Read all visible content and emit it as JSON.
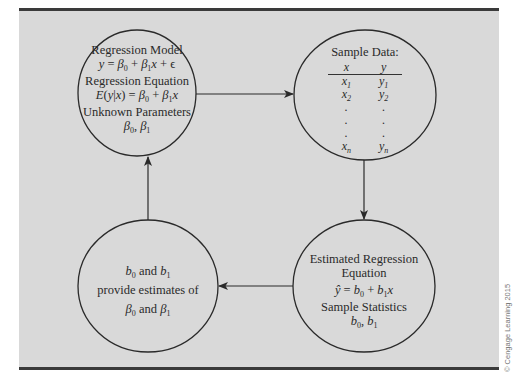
{
  "figure": {
    "type": "regression-process-flow",
    "colors": {
      "panel_background": "#d9d9d9",
      "rule_color": "#3a3a3a",
      "stroke": "#2a2a2a",
      "text": "#2a2a2a"
    },
    "copyright": "© Cengage Learning 2015"
  },
  "nodes": {
    "regression_model": {
      "title": "Regression Model",
      "model_equation": "y = β₀ + β₁x + ϵ",
      "eq_title": "Regression Equation",
      "regression_equation": "E(y|x) = β₀ + β₁x",
      "params_title": "Unknown Parameters",
      "params": "β₀, β₁"
    },
    "sample_data": {
      "title": "Sample Data:",
      "columns": [
        "x",
        "y"
      ],
      "rows": [
        [
          "x1",
          "y1"
        ],
        [
          "x2",
          "y2"
        ],
        [
          ".",
          "."
        ],
        [
          ".",
          "."
        ],
        [
          ".",
          "."
        ],
        [
          "xn",
          "yn"
        ]
      ]
    },
    "estimated_equation": {
      "title_line1": "Estimated Regression",
      "title_line2": "Equation",
      "equation": "ŷ = b₀ + b₁x",
      "stats_title": "Sample Statistics",
      "stats": "b₀, b₁"
    },
    "estimates": {
      "line1": "b₀ and b₁",
      "line2": "provide estimates of",
      "line3": "β₀ and β₁"
    }
  },
  "edges": [
    {
      "from": "regression_model",
      "to": "sample_data",
      "direction": "right"
    },
    {
      "from": "sample_data",
      "to": "estimated_equation",
      "direction": "down"
    },
    {
      "from": "estimated_equation",
      "to": "estimates",
      "direction": "left"
    },
    {
      "from": "estimates",
      "to": "regression_model",
      "direction": "up"
    }
  ]
}
